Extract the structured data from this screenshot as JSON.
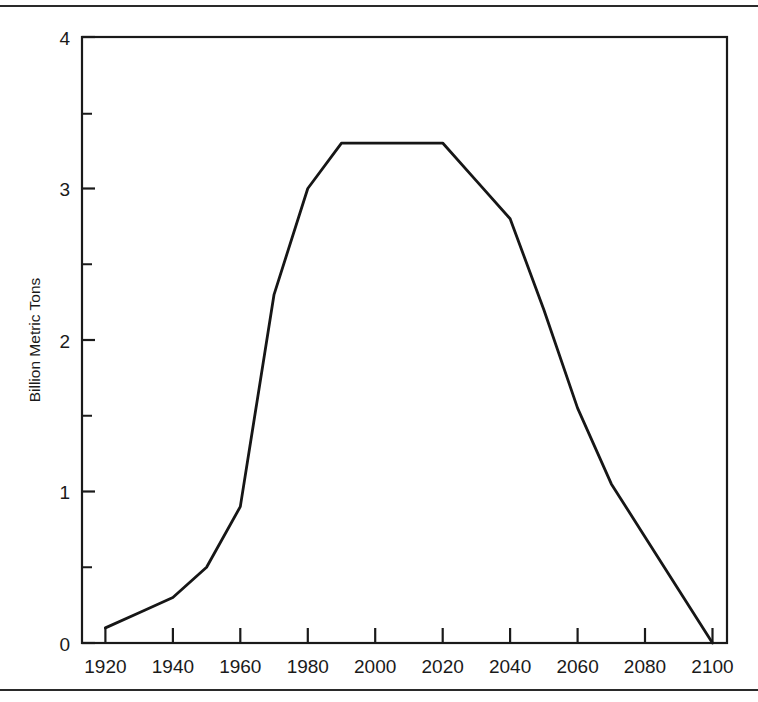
{
  "chart_data": {
    "type": "line",
    "title": "",
    "xlabel": "",
    "ylabel": "Billion Metric Tons",
    "xlim": [
      1920,
      2100
    ],
    "ylim": [
      0,
      4
    ],
    "grid": false,
    "legend": null,
    "x_ticks": [
      1920,
      1940,
      1960,
      1980,
      2000,
      2020,
      2040,
      2060,
      2080,
      2100
    ],
    "x_tick_labels": [
      "1920",
      "1940",
      "1960",
      "1980",
      "2000",
      "2020",
      "2040",
      "2060",
      "2080",
      "2100"
    ],
    "y_ticks": [
      0,
      1,
      2,
      3,
      4
    ],
    "y_tick_labels": [
      "0",
      "1",
      "2",
      "3",
      "4"
    ],
    "y_minor_ticks": [
      0.5,
      1.5,
      2.5,
      3.5
    ],
    "series": [
      {
        "name": "Carbon emissions",
        "color": "#161616",
        "x": [
          1920,
          1930,
          1940,
          1950,
          1960,
          1970,
          1980,
          1990,
          2000,
          2010,
          2020,
          2030,
          2040,
          2050,
          2060,
          2070,
          2080,
          2090,
          2100
        ],
        "values": [
          0.1,
          0.2,
          0.3,
          0.5,
          0.9,
          2.3,
          3.0,
          3.3,
          3.3,
          3.3,
          3.3,
          3.05,
          2.8,
          2.2,
          1.55,
          1.05,
          0.7,
          0.35,
          0.0
        ]
      }
    ],
    "peak_value": 3.3,
    "peak_range": [
      1990,
      2020
    ],
    "start_value": 0.1,
    "end_value": 0.0
  },
  "figure": {
    "y_axis_title": "Billion Metric Tons",
    "frame_color": "#1a1a1a",
    "background": "#ffffff"
  },
  "page": {
    "top_rule": "horizontal-rule",
    "bottom_rule": "horizontal-rule"
  }
}
